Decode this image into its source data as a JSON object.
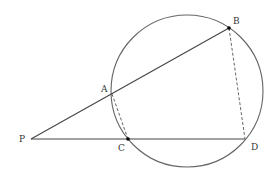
{
  "diagram": {
    "circle": {
      "cx": 187,
      "cy": 91,
      "r": 76
    },
    "points": {
      "P": {
        "label": "P",
        "x": 31,
        "y": 139
      },
      "A": {
        "label": "A",
        "x": 112,
        "y": 94
      },
      "B": {
        "label": "B",
        "x": 229,
        "y": 28
      },
      "C": {
        "label": "C",
        "x": 128,
        "y": 139
      },
      "D": {
        "label": "D",
        "x": 245,
        "y": 139
      }
    },
    "labels": {
      "P": "P",
      "A": "A",
      "B": "B",
      "C": "C",
      "D": "D"
    },
    "segments": [
      {
        "from": "P",
        "to": "B",
        "style": "solid"
      },
      {
        "from": "P",
        "to": "D",
        "style": "solid"
      },
      {
        "from": "A",
        "to": "C",
        "style": "dashed"
      },
      {
        "from": "B",
        "to": "D",
        "style": "dashed"
      }
    ],
    "colors": {
      "stroke": "#555555",
      "text": "#333333",
      "point": "#000000"
    }
  }
}
